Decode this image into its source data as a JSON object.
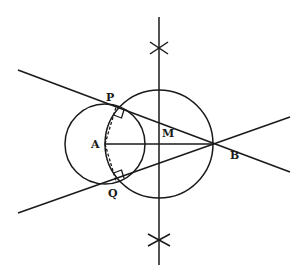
{
  "diagram": {
    "points": {
      "A": {
        "label": "A",
        "x": 105,
        "y": 144
      },
      "B": {
        "label": "B",
        "x": 212,
        "y": 144
      },
      "M": {
        "label": "M",
        "x": 159,
        "y": 144
      },
      "P": {
        "label": "P",
        "x": 116,
        "y": 107
      },
      "Q": {
        "label": "Q",
        "x": 116,
        "y": 181
      }
    },
    "circles": [
      {
        "name": "circle-A",
        "cx": 105,
        "cy": 144,
        "r": 40
      },
      {
        "name": "circle-M",
        "cx": 159,
        "cy": 144,
        "r": 54
      }
    ],
    "lines": {
      "tangent_BP": {
        "x1": 18,
        "y1": 70,
        "x2": 290,
        "y2": 172
      },
      "tangent_BQ": {
        "x1": 18,
        "y1": 213,
        "x2": 290,
        "y2": 117
      },
      "segment_AB": {
        "x1": 105,
        "y1": 144,
        "x2": 212,
        "y2": 144
      },
      "perp_bisector": {
        "x1": 159,
        "y1": 17,
        "x2": 159,
        "y2": 265
      },
      "radius_AP_dashed": {
        "x1": 105,
        "y1": 144,
        "x2": 116,
        "y2": 107
      },
      "radius_AQ_dashed": {
        "x1": 105,
        "y1": 144,
        "x2": 116,
        "y2": 181
      }
    },
    "arc_marks": [
      {
        "name": "top-construction-cross",
        "x": 159,
        "y": 48
      },
      {
        "name": "bottom-construction-cross",
        "x": 159,
        "y": 240
      }
    ],
    "right_angle_marks": [
      "P",
      "Q"
    ],
    "colors": {
      "stroke": "#1a1a1a",
      "background": "#ffffff"
    }
  }
}
